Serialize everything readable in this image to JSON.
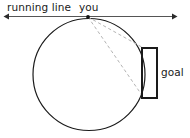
{
  "figure": {
    "canvas": {
      "width": 190,
      "height": 138,
      "background": "#ffffff"
    },
    "labels": {
      "running_line": "running line",
      "you": "you",
      "goal": "goal"
    },
    "colors": {
      "stroke": "#1a1a1a",
      "dashed": "#b0b0b0",
      "axis": "#2b2b2b",
      "text": "#1a1a1a",
      "background": "#ffffff"
    },
    "elements": {
      "running_line": {
        "name": "running-line",
        "y": 16,
        "x_start": 4,
        "x_end": 177,
        "arrowheads": "both",
        "stroke_width": 1
      },
      "you_point": {
        "name": "you-point",
        "x": 88,
        "y": 17,
        "radius": 1.9
      },
      "circle": {
        "name": "field-circle",
        "cx": 89,
        "cy": 74.5,
        "r": 56,
        "stroke_width": 1.2,
        "fill": "none"
      },
      "goal_rect": {
        "name": "goal-rectangle",
        "x": 142,
        "y": 48,
        "width": 15,
        "height": 50,
        "stroke_width": 2,
        "fill": "none",
        "open_side": "left"
      },
      "sight_lines": [
        {
          "name": "sight-line-upper",
          "x1": 88,
          "y1": 17,
          "x2": 143.5,
          "y2": 48
        },
        {
          "name": "sight-line-lower",
          "x1": 88,
          "y1": 17,
          "x2": 142.5,
          "y2": 96
        }
      ]
    }
  }
}
